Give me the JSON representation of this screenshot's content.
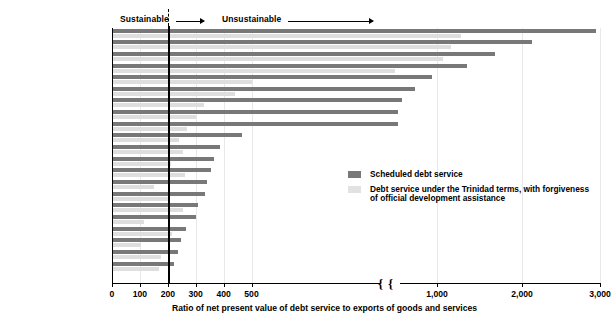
{
  "header": {
    "sustainable_label": "Sustainable",
    "unsustainable_label": "Unsustainable"
  },
  "legend": {
    "items": [
      {
        "key": "scheduled",
        "label": "Scheduled debt service",
        "color": "#787878"
      },
      {
        "key": "trinidad",
        "label": "Debt service under the Trinidad terms, with forgiveness of official development assistance",
        "color": "#e2e2e2"
      }
    ]
  },
  "axis": {
    "title": "Ratio of net present value of debt service to exports of goods and services",
    "ticks": [
      "0",
      "100",
      "200",
      "300",
      "400",
      "500",
      "1,000",
      "2,000",
      "3,000"
    ],
    "threshold": 200,
    "break_after": 500
  },
  "chart_data": {
    "type": "bar",
    "orientation": "horizontal",
    "title": "",
    "xlabel": "Ratio of net present value of debt service to exports of goods and services",
    "ylabel": "",
    "xlim": [
      0,
      3000
    ],
    "xticks": [
      0,
      100,
      200,
      300,
      400,
      500,
      1000,
      2000,
      3000
    ],
    "axis_break": [
      500,
      1000
    ],
    "grid": true,
    "legend_position": "middle-right",
    "annotations": [
      {
        "text": "Sustainable",
        "at_x": 200,
        "direction": "left"
      },
      {
        "text": "Unsustainable",
        "at_x": 200,
        "direction": "right"
      },
      {
        "text": "threshold line",
        "at_x": 200
      }
    ],
    "categories": [
      "Somalia",
      "Guinea-Bissau",
      "Sudan",
      "Mozambique",
      "São Tomé and Principe",
      "Tanzania",
      "Uganda",
      "Madagascar",
      "Sierra Leone",
      "Zambia",
      "Equatorial Guinea",
      "Zaire",
      "Burundi",
      "Mauritania",
      "Nigeria",
      "Niger",
      "Ethiopia",
      "Kenya",
      "Guinea",
      "Malawi",
      "Ghana"
    ],
    "series": [
      {
        "name": "Scheduled debt service",
        "color": "#787878",
        "values": [
          2950,
          2130,
          1680,
          1350,
          940,
          740,
          590,
          540,
          540,
          465,
          388,
          365,
          356,
          341,
          332,
          308,
          300,
          266,
          249,
          236,
          223
        ]
      },
      {
        "name": "Debt service under the Trinidad terms, with forgiveness of official development assistance",
        "color": "#dedede",
        "values": [
          1280,
          1160,
          1070,
          510,
          500,
          440,
          330,
          300,
          270,
          240,
          255,
          212,
          262,
          150,
          205,
          255,
          115,
          215,
          105,
          175,
          168
        ]
      }
    ]
  }
}
